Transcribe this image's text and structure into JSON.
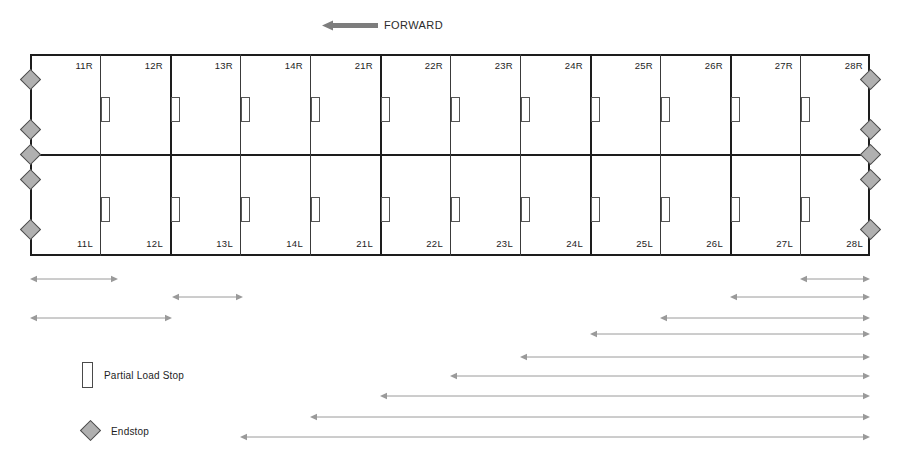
{
  "forward": {
    "label": "FORWARD",
    "icon": "arrow-left-thick-icon",
    "direction": "left"
  },
  "grid": {
    "rows": 2,
    "columns": 12,
    "upper_row_suffix": "R",
    "lower_row_suffix": "L",
    "cells_upper": [
      "11R",
      "12R",
      "13R",
      "14R",
      "21R",
      "22R",
      "23R",
      "24R",
      "25R",
      "26R",
      "27R",
      "28R"
    ],
    "cells_lower": [
      "11L",
      "12L",
      "13L",
      "14L",
      "21L",
      "22L",
      "23L",
      "24L",
      "25L",
      "26L",
      "27L",
      "28L"
    ],
    "column_edges": [
      0,
      70,
      140,
      210,
      280,
      350,
      420,
      490,
      560,
      630,
      700,
      770,
      840
    ],
    "thick_dividers_at": [
      140,
      350,
      560,
      700
    ],
    "endstops_left": 5,
    "endstops_right": 5,
    "endstop_positions_y": [
      25,
      75,
      100,
      125,
      175
    ],
    "load_stops_per_row": 11,
    "outline_color": "#1d1d1d",
    "divider_color": "#3a3a3a",
    "endstop_fill": "#b0b0b0",
    "endstop_stroke": "#4a4a4a",
    "load_stop_stroke": "#555555"
  },
  "dimension_arrows": {
    "color": "#9a9a9a",
    "note": "Double-headed horizontal measurement arrows below the grid",
    "rows": [
      {
        "y": 279,
        "x1": 30,
        "x2": 118
      },
      {
        "y": 279,
        "x1": 800,
        "x2": 870
      },
      {
        "y": 297,
        "x1": 172,
        "x2": 243
      },
      {
        "y": 297,
        "x1": 730,
        "x2": 870
      },
      {
        "y": 318,
        "x1": 30,
        "x2": 172
      },
      {
        "y": 318,
        "x1": 660,
        "x2": 870
      },
      {
        "y": 334,
        "x1": 590,
        "x2": 870
      },
      {
        "y": 357,
        "x1": 520,
        "x2": 870
      },
      {
        "y": 376,
        "x1": 450,
        "x2": 870
      },
      {
        "y": 396,
        "x1": 380,
        "x2": 870
      },
      {
        "y": 417,
        "x1": 310,
        "x2": 870
      },
      {
        "y": 437,
        "x1": 240,
        "x2": 870
      }
    ]
  },
  "legend": {
    "items": [
      {
        "icon": "partial-load-stop-icon",
        "label": "Partial Load Stop"
      },
      {
        "icon": "endstop-diamond-icon",
        "label": "Endstop"
      }
    ]
  }
}
